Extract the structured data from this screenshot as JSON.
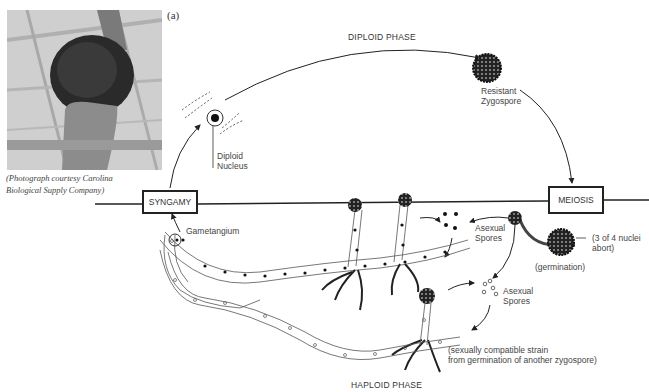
{
  "figure": {
    "panel_label": "(a)",
    "photo_caption_line1": "(Photograph courtesy Carolina",
    "photo_caption_line2": "Biological Supply Company)"
  },
  "phases": {
    "diploid": "DIPLOID PHASE",
    "haploid": "HAPLOID PHASE"
  },
  "stages": {
    "syngamy": "SYNGAMY",
    "meiosis": "MEIOSIS"
  },
  "labels": {
    "diploid_nucleus_1": "Diploid",
    "diploid_nucleus_2": "Nucleus",
    "zygospore_1": "Resistant",
    "zygospore_2": "Zygospore",
    "gametangium": "Gametangium",
    "asexual_spores_a_1": "Asexual",
    "asexual_spores_a_2": "Spores",
    "asexual_spores_b_1": "Asexual",
    "asexual_spores_b_2": "Spores",
    "nuclei_abort_1": "(3 of 4 nuclei",
    "nuclei_abort_2": "abort)",
    "germination": "(germination)",
    "compatible_strain_1": "(sexually compatible strain",
    "compatible_strain_2": "from germination of another zygospore)"
  }
}
